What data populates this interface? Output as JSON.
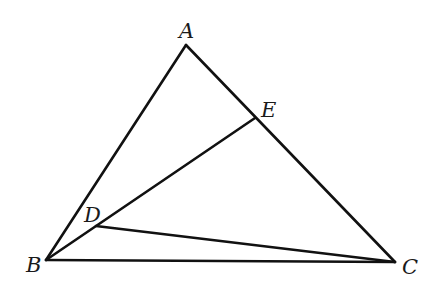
{
  "diagram": {
    "type": "geometry-triangle",
    "points": {
      "A": {
        "label": "A",
        "x": 186,
        "y": 45,
        "label_x": 179,
        "label_y": 38
      },
      "B": {
        "label": "B",
        "x": 46,
        "y": 260,
        "label_x": 26,
        "label_y": 272
      },
      "C": {
        "label": "C",
        "x": 395,
        "y": 262,
        "label_x": 402,
        "label_y": 274
      },
      "D": {
        "label": "D",
        "x": 96,
        "y": 226,
        "label_x": 84,
        "label_y": 222
      },
      "E": {
        "label": "E",
        "x": 255,
        "y": 118,
        "label_x": 261,
        "label_y": 117
      }
    },
    "segments": [
      {
        "from": "A",
        "to": "B"
      },
      {
        "from": "A",
        "to": "C"
      },
      {
        "from": "B",
        "to": "C"
      },
      {
        "from": "B",
        "to": "E"
      },
      {
        "from": "D",
        "to": "C"
      }
    ],
    "stroke_color": "#111111",
    "background": "#ffffff"
  }
}
